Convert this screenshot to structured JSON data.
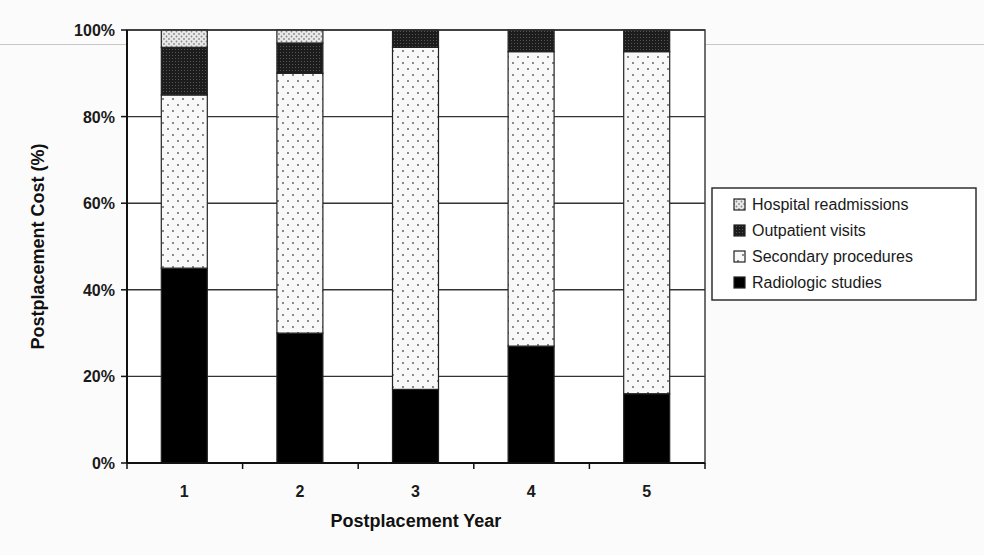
{
  "chart_data": {
    "type": "bar",
    "stacked": true,
    "percent_stacked": true,
    "title": "",
    "xlabel": "Postplacement Year",
    "ylabel": "Postplacement Cost (%)",
    "categories": [
      "1",
      "2",
      "3",
      "4",
      "5"
    ],
    "ylim": [
      0,
      100
    ],
    "yticks": [
      "0%",
      "20%",
      "40%",
      "60%",
      "80%",
      "100%"
    ],
    "grid": "horizontal",
    "legend_position": "right",
    "series": [
      {
        "name": "Radiologic studies",
        "pattern": "solid-black",
        "values": [
          45,
          30,
          17,
          27,
          16
        ]
      },
      {
        "name": "Secondary procedures",
        "pattern": "sparse-dots",
        "values": [
          40,
          60,
          79,
          68,
          79
        ]
      },
      {
        "name": "Outpatient visits",
        "pattern": "dense-dark",
        "values": [
          11,
          7,
          4,
          5,
          5
        ]
      },
      {
        "name": "Hospital readmissions",
        "pattern": "light-dots",
        "values": [
          4,
          3,
          0,
          0,
          0
        ]
      }
    ]
  },
  "legend": {
    "items": [
      {
        "label": "Hospital readmissions",
        "pattern": "light-dots"
      },
      {
        "label": "Outpatient visits",
        "pattern": "dense-dark"
      },
      {
        "label": "Secondary procedures",
        "pattern": "sparse-dots"
      },
      {
        "label": "Radiologic studies",
        "pattern": "solid-black"
      }
    ]
  },
  "colors": {
    "axis": "#222222",
    "grid": "#333333",
    "radiologic": "#000000",
    "secondary_bg": "#f7f7f7",
    "outpatient": "#222222",
    "hospital_bg": "#e4e4e4"
  }
}
